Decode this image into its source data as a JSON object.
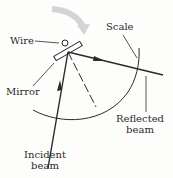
{
  "diagram": {
    "labels": {
      "wire": "Wire",
      "mirror": "Mirror",
      "scale": "Scale",
      "reflected_line1": "Reflected",
      "reflected_line2": "beam",
      "incident_line1": "Incident",
      "incident_line2": "beam"
    },
    "colors": {
      "line": "#2a2a2a",
      "rotation_arrow": "#d0d0d0",
      "background": "#fdfdfb"
    }
  }
}
